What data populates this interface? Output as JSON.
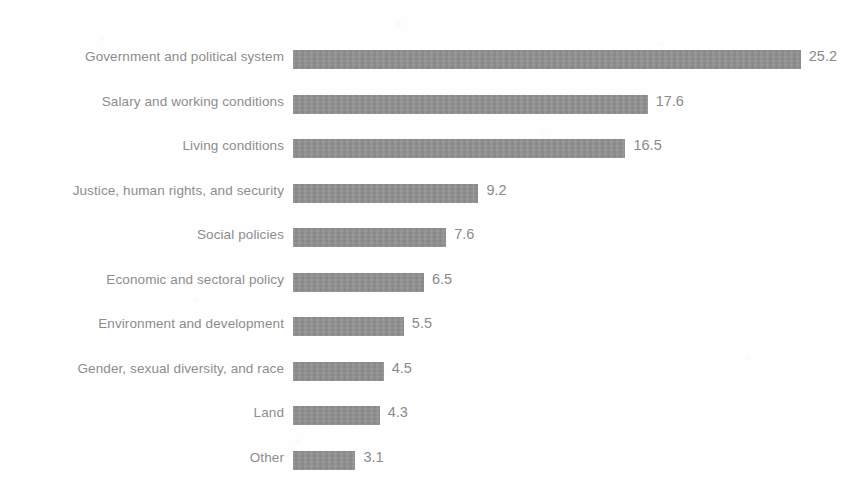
{
  "chart": {
    "background_color": "#fefefe",
    "bar_color": "#8e8e8e",
    "label_color": "#8d8d8d",
    "value_color": "#8a8a8a"
  },
  "chart_data": {
    "type": "bar",
    "orientation": "horizontal",
    "title": "",
    "subtitle": "",
    "xlabel": "",
    "ylabel": "",
    "grid": false,
    "legend": false,
    "axis_visible": false,
    "value_labels_shown": true,
    "xlim": [
      0,
      25.2
    ],
    "categories": [
      "Government and political system",
      "Salary and working conditions",
      "Living conditions",
      "Justice, human rights, and security",
      "Social policies",
      "Economic and sectoral policy",
      "Environment and development",
      "Gender, sexual diversity, and race",
      "Land",
      "Other"
    ],
    "values": [
      25.2,
      17.6,
      16.5,
      9.2,
      7.6,
      6.5,
      5.5,
      4.5,
      4.3,
      3.1
    ],
    "value_labels": [
      "25.2",
      "17.6",
      "16.5",
      "9.2",
      "7.6",
      "6.5",
      "5.5",
      "4.5",
      "4.3",
      "3.1"
    ]
  },
  "layout": {
    "bar_origin_x": 293,
    "pixels_per_unit": 20.15,
    "bar_height": 19,
    "row_pitch": 44.5,
    "first_row_top": 50,
    "value_gap": 8
  }
}
